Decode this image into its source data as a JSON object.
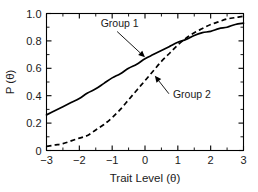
{
  "chart_data": {
    "type": "line",
    "title": "",
    "subtitle": "",
    "xlabel": "Trait Level (θ)",
    "ylabel": "P (θ)",
    "xlim": [
      -3,
      3
    ],
    "ylim": [
      0,
      1.0
    ],
    "grid": false,
    "legend_position": "inline-annotations",
    "x_ticks": [
      -3,
      -2,
      -1,
      0,
      1,
      2,
      3
    ],
    "x_ticklabels": [
      "−3",
      "−2",
      "−1",
      "0",
      "1",
      "2",
      "3"
    ],
    "x_minor_ticks": [
      -2.5,
      -1.5,
      -0.5,
      0.5,
      1.5,
      2.5
    ],
    "y_ticks": [
      0,
      0.2,
      0.4,
      0.6,
      0.8,
      1.0
    ],
    "y_ticklabels": [
      "0",
      "0.2",
      "0.4",
      "0.6",
      "0.8",
      "1.0"
    ],
    "y_minor_ticks": [
      0.1,
      0.3,
      0.5,
      0.7,
      0.9
    ],
    "x": [
      -3.0,
      -2.75,
      -2.5,
      -2.25,
      -2.0,
      -1.75,
      -1.5,
      -1.25,
      -1.0,
      -0.75,
      -0.5,
      -0.25,
      0.0,
      0.25,
      0.5,
      0.75,
      1.0,
      1.25,
      1.5,
      1.75,
      2.0,
      2.25,
      2.5,
      2.75,
      3.0
    ],
    "series": [
      {
        "name": "Group 1",
        "style": "solid",
        "color": "#000000",
        "values": [
          0.26,
          0.29,
          0.32,
          0.35,
          0.38,
          0.42,
          0.45,
          0.49,
          0.53,
          0.56,
          0.6,
          0.63,
          0.67,
          0.7,
          0.73,
          0.76,
          0.79,
          0.81,
          0.84,
          0.86,
          0.87,
          0.89,
          0.9,
          0.92,
          0.93
        ]
      },
      {
        "name": "Group 2",
        "style": "dashed",
        "color": "#000000",
        "values": [
          0.03,
          0.04,
          0.05,
          0.07,
          0.09,
          0.11,
          0.15,
          0.19,
          0.24,
          0.3,
          0.37,
          0.44,
          0.51,
          0.58,
          0.65,
          0.71,
          0.77,
          0.82,
          0.86,
          0.89,
          0.92,
          0.94,
          0.96,
          0.97,
          0.98
        ]
      }
    ],
    "crossing_point": {
      "x": 1.2,
      "y": 0.82
    },
    "annotations": [
      {
        "label": "Group 1",
        "text_x": -1.35,
        "text_y": 0.905,
        "target_x": 0.0,
        "target_y": 0.68
      },
      {
        "label": "Group 2",
        "text_x": 0.85,
        "text_y": 0.385,
        "target_x": 0.3,
        "target_y": 0.545
      }
    ]
  },
  "figure": {
    "background_color": "#ffffff",
    "axis_color": "#000000"
  }
}
